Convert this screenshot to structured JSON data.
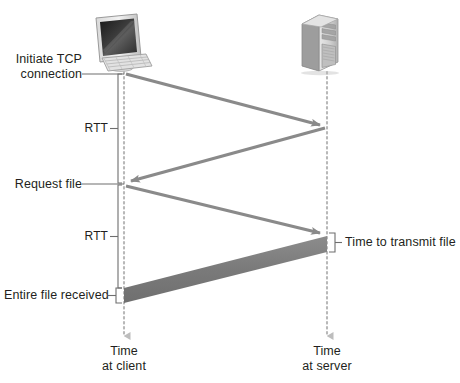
{
  "figure": {
    "type": "sequence-timing-diagram",
    "title": "",
    "background_color": "#ffffff",
    "width": 460,
    "height": 383
  },
  "nodes": [
    {
      "id": "client",
      "icon": "desktop-computer-icon",
      "timeline_label_line1": "Time",
      "timeline_label_line2": "at client",
      "timeline_x": 124,
      "timeline_top": 72,
      "timeline_bottom": 336
    },
    {
      "id": "server",
      "icon": "server-tower-icon",
      "timeline_label_line1": "Time",
      "timeline_label_line2": "at server",
      "timeline_x": 327,
      "timeline_top": 72,
      "timeline_bottom": 336
    }
  ],
  "events": [
    {
      "id": "initiate-tcp",
      "label_line1": "Initiate TCP",
      "label_line2": "connection",
      "side": "client",
      "y": 73
    },
    {
      "id": "request-file",
      "label_line1": "Request file",
      "label_line2": "",
      "side": "client",
      "y": 183
    },
    {
      "id": "entire-file-received",
      "label_line1": "Entire file received",
      "label_line2": "",
      "side": "client",
      "y": 295
    },
    {
      "id": "time-to-transmit-file",
      "label_line1": "Time to transmit file",
      "label_line2": "",
      "side": "server",
      "y": 240
    }
  ],
  "measures": [
    {
      "id": "rtt-1",
      "label": "RTT",
      "from_y": 73,
      "to_y": 183,
      "bracket_x": 124
    },
    {
      "id": "rtt-2",
      "label": "RTT",
      "from_y": 183,
      "to_y": 295,
      "bracket_x": 124
    },
    {
      "id": "transmit-time",
      "label": "Time to transmit file",
      "from_y": 233,
      "to_y": 251,
      "bracket_x": 327
    }
  ],
  "messages": [
    {
      "id": "syn-arrow",
      "from": "client",
      "to": "server",
      "from_y": 73,
      "to_y": 125,
      "style": "thin-arrow",
      "color": "#8a8a8a"
    },
    {
      "id": "synack-arrow",
      "from": "server",
      "to": "client",
      "from_y": 128,
      "to_y": 181,
      "style": "thin-arrow",
      "color": "#8a8a8a"
    },
    {
      "id": "request-arrow",
      "from": "client",
      "to": "server",
      "from_y": 185,
      "to_y": 233,
      "style": "thin-arrow",
      "color": "#8a8a8a"
    },
    {
      "id": "file-transfer-band",
      "from": "server",
      "to": "client",
      "from_y_top": 236,
      "from_y_bottom": 252,
      "to_y_top": 288,
      "to_y_bottom": 303,
      "style": "thick-band",
      "color": "#808080"
    }
  ],
  "colors": {
    "arrow": "#8a8a8a",
    "band": "#7f7f7f",
    "text": "#231f20",
    "timeline_dotted": "#b3b3b3",
    "leader_line": "#6e6e6e"
  }
}
